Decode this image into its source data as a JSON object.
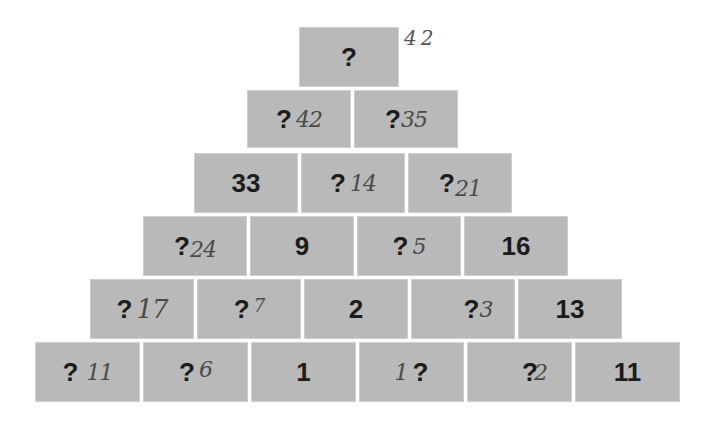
{
  "puzzle": {
    "type": "number-pyramid",
    "top_annotation": "42",
    "rows": [
      {
        "cells": [
          {
            "printed": "?",
            "handwritten": ""
          }
        ]
      },
      {
        "cells": [
          {
            "printed": "?",
            "handwritten": "42"
          },
          {
            "printed": "?",
            "handwritten": "35"
          }
        ]
      },
      {
        "cells": [
          {
            "printed": "33",
            "handwritten": ""
          },
          {
            "printed": "?",
            "handwritten": "14"
          },
          {
            "printed": "?",
            "handwritten": "21"
          }
        ]
      },
      {
        "cells": [
          {
            "printed": "?",
            "handwritten": "24"
          },
          {
            "printed": "9",
            "handwritten": ""
          },
          {
            "printed": "?",
            "handwritten": "5"
          },
          {
            "printed": "16",
            "handwritten": ""
          }
        ]
      },
      {
        "cells": [
          {
            "printed": "?",
            "handwritten": "17"
          },
          {
            "printed": "?",
            "handwritten": "7"
          },
          {
            "printed": "2",
            "handwritten": ""
          },
          {
            "printed": "?",
            "handwritten": "3"
          },
          {
            "printed": "13",
            "handwritten": ""
          }
        ]
      },
      {
        "cells": [
          {
            "printed": "?",
            "handwritten": "11"
          },
          {
            "printed": "?",
            "handwritten": "6"
          },
          {
            "printed": "1",
            "handwritten": ""
          },
          {
            "printed": "?",
            "handwritten": "1",
            "handwritten_position": "before"
          },
          {
            "printed": "?",
            "handwritten": "2"
          },
          {
            "printed": "11",
            "handwritten": ""
          }
        ]
      }
    ]
  },
  "colors": {
    "block_fill": "#b9b9b9",
    "block_border": "#cfcfcf",
    "printed_text": "#1c1c1c",
    "handwriting": "#4a4a4a",
    "background": "#ffffff"
  }
}
